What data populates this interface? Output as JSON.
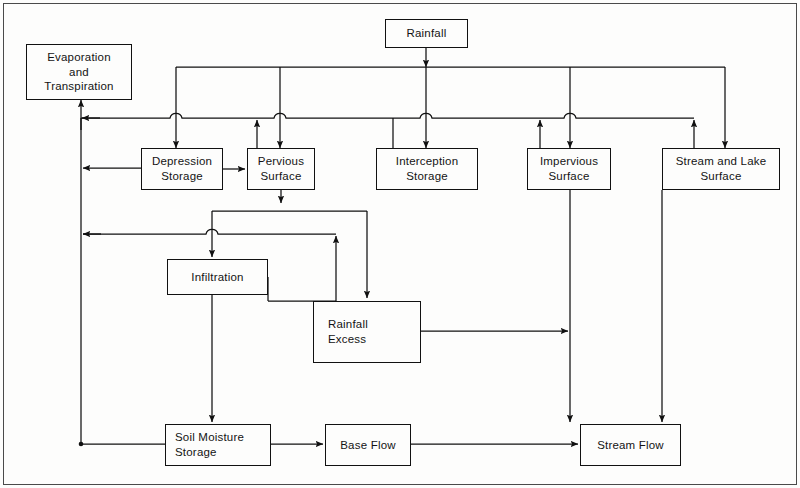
{
  "diagram": {
    "type": "flowchart",
    "line_color": "#111111",
    "text_color": "#141414",
    "background_color": "#fdfdfc",
    "nodes": [
      {
        "id": "evaporation",
        "label": "Evaporation\nand\nTranspiration",
        "x": 26,
        "y": 44,
        "w": 106,
        "h": 56
      },
      {
        "id": "rainfall",
        "label": "Rainfall",
        "x": 385,
        "y": 19,
        "w": 83,
        "h": 29
      },
      {
        "id": "depression",
        "label": "Depression\nStorage",
        "x": 141,
        "y": 148,
        "w": 82,
        "h": 42
      },
      {
        "id": "pervious",
        "label": "Pervious\nSurface",
        "x": 247,
        "y": 148,
        "w": 68,
        "h": 42
      },
      {
        "id": "interception",
        "label": "Interception\nStorage",
        "x": 376,
        "y": 148,
        "w": 102,
        "h": 42
      },
      {
        "id": "impervious",
        "label": "Impervious\nSurface",
        "x": 527,
        "y": 148,
        "w": 84,
        "h": 42
      },
      {
        "id": "streamlake",
        "label": "Stream  and  Lake\nSurface",
        "x": 662,
        "y": 148,
        "w": 118,
        "h": 42
      },
      {
        "id": "infiltration",
        "label": "Infiltration",
        "x": 167,
        "y": 259,
        "w": 101,
        "h": 36
      },
      {
        "id": "rainexcess",
        "label": "Rainfall\nExcess",
        "x": 313,
        "y": 301,
        "w": 108,
        "h": 62
      },
      {
        "id": "soilmoisture",
        "label": "Soil  Moisture\nStorage",
        "x": 165,
        "y": 424,
        "w": 106,
        "h": 42
      },
      {
        "id": "baseflow",
        "label": "Base Flow",
        "x": 325,
        "y": 424,
        "w": 86,
        "h": 42
      },
      {
        "id": "streamflow",
        "label": "Stream  Flow",
        "x": 580,
        "y": 424,
        "w": 101,
        "h": 42
      }
    ],
    "edges": [
      {
        "from": "rainfall",
        "to": "depression",
        "kind": "rain-distribution"
      },
      {
        "from": "rainfall",
        "to": "pervious",
        "kind": "rain-distribution"
      },
      {
        "from": "rainfall",
        "to": "interception",
        "kind": "rain-distribution"
      },
      {
        "from": "rainfall",
        "to": "impervious",
        "kind": "rain-distribution"
      },
      {
        "from": "rainfall",
        "to": "streamlake",
        "kind": "rain-distribution"
      },
      {
        "from": "depression",
        "to": "evaporation",
        "kind": "evaporation-return"
      },
      {
        "from": "pervious",
        "to": "evaporation",
        "kind": "evaporation-return"
      },
      {
        "from": "interception",
        "to": "evaporation",
        "kind": "evaporation-return"
      },
      {
        "from": "impervious",
        "to": "evaporation",
        "kind": "evaporation-return"
      },
      {
        "from": "streamlake",
        "to": "evaporation",
        "kind": "evaporation-return"
      },
      {
        "from": "soilmoisture",
        "to": "evaporation",
        "kind": "evaporation-return"
      },
      {
        "from": "depression",
        "to": "pervious",
        "kind": "direct"
      },
      {
        "from": "pervious",
        "to": "infiltration",
        "kind": "split"
      },
      {
        "from": "pervious",
        "to": "rainexcess",
        "kind": "split"
      },
      {
        "from": "infiltration",
        "to": "soilmoisture",
        "kind": "direct"
      },
      {
        "from": "infiltration",
        "to": "rainexcess",
        "kind": "direct"
      },
      {
        "from": "impervious",
        "to": "streamflow",
        "kind": "direct"
      },
      {
        "from": "streamlake",
        "to": "streamflow",
        "kind": "direct"
      },
      {
        "from": "rainexcess",
        "to": "streamflow",
        "kind": "direct"
      },
      {
        "from": "soilmoisture",
        "to": "baseflow",
        "kind": "direct"
      },
      {
        "from": "baseflow",
        "to": "streamflow",
        "kind": "direct"
      }
    ],
    "buses": [
      {
        "id": "rainfall-bus",
        "y": 67,
        "x1": 176,
        "x2": 725
      },
      {
        "id": "evaporation-bus",
        "y": 118,
        "x1": 81,
        "x2": 694
      },
      {
        "id": "pervious-split-bus",
        "y": 211,
        "x1": 212,
        "x2": 367
      },
      {
        "id": "soil-return-bus",
        "y": 234,
        "x1": 81,
        "x2": 336
      }
    ]
  }
}
